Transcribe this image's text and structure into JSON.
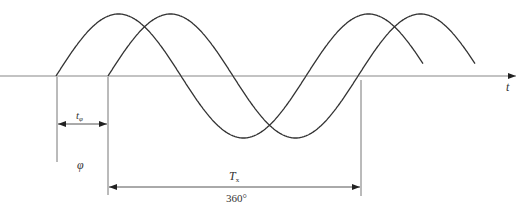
{
  "diagram": {
    "type": "phase-shift-sine-waves",
    "labels": {
      "time_axis": "t",
      "phase_time": "t",
      "phase_time_sub": "φ",
      "phase_angle": "φ",
      "period": "T",
      "period_sub": "x",
      "period_degrees": "360°"
    },
    "geometry": {
      "axis_y": 76,
      "axis_x_start": 0,
      "axis_x_end": 516,
      "amplitude": 62,
      "period_px": 250,
      "wave1": {
        "start_x": 56,
        "end_x": 423
      },
      "wave2": {
        "start_x": 108,
        "end_x": 475
      }
    },
    "colors": {
      "line": "#333333",
      "axis": "#888888",
      "background": "#ffffff"
    }
  }
}
